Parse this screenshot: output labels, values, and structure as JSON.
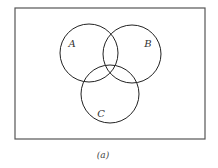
{
  "diagram": {
    "type": "venn",
    "universe": {
      "x": 15,
      "y": 8,
      "width": 190,
      "height": 131,
      "stroke": "#555555"
    },
    "sets": [
      {
        "label": "A",
        "cx": 89,
        "cy": 53,
        "r": 29,
        "label_x": 72,
        "label_y": 46
      },
      {
        "label": "B",
        "cx": 132,
        "cy": 54,
        "r": 29,
        "label_x": 148,
        "label_y": 46
      },
      {
        "label": "C",
        "cx": 110,
        "cy": 94,
        "r": 29,
        "label_x": 101,
        "label_y": 116
      }
    ],
    "stroke_color": "#222222",
    "caption": "(a)"
  }
}
